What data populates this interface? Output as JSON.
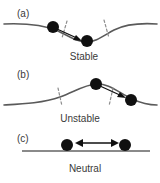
{
  "figure": {
    "background_color": "#ffffff",
    "ball_color": "#101010",
    "curve_color": "#5a5a5a",
    "dashed_color": "#8d8d8d",
    "flat_line_color": "#8a8a8a",
    "text_color": "#3a3a3a"
  },
  "panels": [
    {
      "id": "a",
      "label": "(a)",
      "caption": "Stable",
      "shape": "valley",
      "description": "Concave-up valley curve with a ball on the left slope and a ball resting at the bottom; arrow points down-slope toward the minimum.",
      "arrow": {
        "type": "single",
        "direction": "down-right",
        "from": "upper-left-ball",
        "to": "bottom-ball"
      },
      "balls": [
        {
          "name": "ball-on-slope",
          "cx": 53,
          "cy": 27,
          "r": 6
        },
        {
          "name": "ball-at-minimum",
          "cx": 87,
          "cy": 41,
          "r": 6
        }
      ],
      "dashed_lines": 2
    },
    {
      "id": "b",
      "label": "(b)",
      "caption": "Unstable",
      "shape": "hill",
      "description": "Concave-down hill curve with a ball balanced at the peak and a ball rolling down the right slope; arrow points down-slope away from the maximum.",
      "arrow": {
        "type": "single",
        "direction": "down-right",
        "from": "peak-ball",
        "to": "lower-right-ball"
      },
      "balls": [
        {
          "name": "ball-at-peak",
          "cx": 96,
          "cy": 84,
          "r": 6
        },
        {
          "name": "ball-on-slope",
          "cx": 131,
          "cy": 100,
          "r": 6
        }
      ],
      "dashed_lines": 2
    },
    {
      "id": "c",
      "label": "(c)",
      "caption": "Neutral",
      "shape": "flat",
      "description": "Horizontal flat line with two balls resting on it and a double-headed arrow between them indicating free displacement in either direction.",
      "arrow": {
        "type": "double",
        "direction": "left-right",
        "from": "left-ball",
        "to": "right-ball"
      },
      "balls": [
        {
          "name": "ball-left",
          "cx": 67,
          "cy": 145,
          "r": 6
        },
        {
          "name": "ball-right",
          "cx": 125,
          "cy": 145,
          "r": 6
        }
      ],
      "dashed_lines": 0
    }
  ]
}
